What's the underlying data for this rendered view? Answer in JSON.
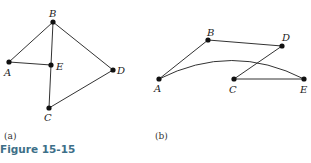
{
  "figure": {
    "title": "Figure 15-15",
    "accent_color": "#3d6f88"
  },
  "graphs": [
    {
      "caption": "(a)",
      "nodes": [
        {
          "id": "A",
          "x": 9,
          "y": 62
        },
        {
          "id": "B",
          "x": 53,
          "y": 22
        },
        {
          "id": "C",
          "x": 49,
          "y": 108
        },
        {
          "id": "D",
          "x": 113,
          "y": 70
        },
        {
          "id": "E",
          "x": 51,
          "y": 65
        }
      ],
      "edges": [
        [
          "A",
          "B"
        ],
        [
          "A",
          "E"
        ],
        [
          "B",
          "E"
        ],
        [
          "E",
          "C"
        ],
        [
          "B",
          "D"
        ],
        [
          "C",
          "D"
        ]
      ]
    },
    {
      "caption": "(b)",
      "nodes": [
        {
          "id": "A",
          "x": 159,
          "y": 79
        },
        {
          "id": "B",
          "x": 208,
          "y": 40
        },
        {
          "id": "C",
          "x": 234,
          "y": 79
        },
        {
          "id": "D",
          "x": 282,
          "y": 46
        },
        {
          "id": "E",
          "x": 304,
          "y": 79
        }
      ],
      "edges": [
        [
          "A",
          "B"
        ],
        [
          "B",
          "D"
        ],
        [
          "D",
          "C"
        ],
        [
          "C",
          "E"
        ],
        [
          "A",
          "E",
          "curved"
        ]
      ]
    }
  ]
}
